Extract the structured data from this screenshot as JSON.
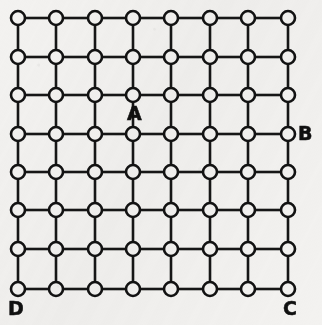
{
  "figure": {
    "type": "lattice-graph-diagram",
    "background_color": "#f3f2f0",
    "ink_color": "#141414",
    "width": 322,
    "height": 325
  },
  "grid": {
    "rows": 8,
    "columns": 8,
    "node_count": 64,
    "node_radius": 7,
    "edge_stroke_width": 2.6,
    "node_stroke_width": 2.6,
    "column_centers_px": [
      18,
      56,
      95,
      133,
      171,
      210,
      248,
      288
    ],
    "row_centers_px": [
      18,
      57,
      95,
      134,
      172,
      210,
      249,
      289
    ],
    "horizontal_edges_per_row": 7,
    "vertical_edges_per_column": 7
  },
  "labels": [
    {
      "id": "label-a",
      "text": "A",
      "node_row": 3,
      "node_col": 4,
      "placement": "below",
      "x": 127,
      "y": 104
    },
    {
      "id": "label-b",
      "text": "B",
      "node_row": 4,
      "node_col": 8,
      "placement": "right",
      "x": 298,
      "y": 124
    },
    {
      "id": "label-c",
      "text": "C",
      "node_row": 8,
      "node_col": 8,
      "placement": "below",
      "x": 283,
      "y": 299
    },
    {
      "id": "label-d",
      "text": "D",
      "node_row": 8,
      "node_col": 1,
      "placement": "below",
      "x": 8,
      "y": 299
    }
  ]
}
